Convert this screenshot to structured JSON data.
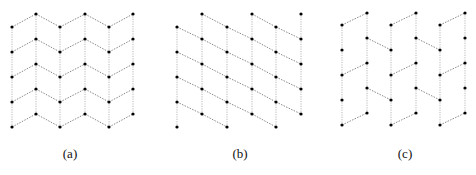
{
  "panels": [
    {
      "id": "a",
      "label": "(a)",
      "label_x": 70,
      "columns": [
        12,
        36,
        60,
        85,
        109,
        133
      ],
      "column_rows": [
        [
          27,
          52,
          77,
          102,
          127
        ],
        [
          14,
          39,
          64,
          89,
          114
        ],
        [
          27,
          52,
          77,
          102,
          127
        ],
        [
          14,
          39,
          64,
          89,
          114
        ],
        [
          27,
          52,
          77,
          102,
          127
        ],
        [
          14,
          39,
          64,
          89,
          114
        ]
      ],
      "edges": "zigzag-all"
    },
    {
      "id": "b",
      "label": "(b)",
      "label_x": 240,
      "columns": [
        177,
        202,
        227,
        252,
        276,
        301
      ],
      "column_rows": [
        [
          27,
          52,
          77,
          102,
          127
        ],
        [
          14,
          39,
          64,
          89,
          114
        ],
        [
          27,
          52,
          77,
          102,
          127
        ],
        [
          14,
          39,
          64,
          89,
          114
        ],
        [
          27,
          52,
          77,
          102,
          127
        ],
        [
          14,
          39,
          64,
          89,
          114
        ]
      ],
      "edges": "parallel-down"
    },
    {
      "id": "c",
      "label": "(c)",
      "label_x": 405,
      "columns": [
        342,
        367,
        391,
        416,
        440,
        465
      ],
      "column_rows": [
        [
          25,
          50,
          75,
          100,
          125
        ],
        [
          13,
          38,
          63,
          88,
          113
        ],
        [
          25,
          50,
          75,
          100,
          125
        ],
        [
          13,
          38,
          63,
          88,
          113
        ],
        [
          25,
          50,
          75,
          100,
          125
        ],
        [
          13,
          38,
          63,
          88,
          113
        ]
      ],
      "edges": "paired-alternating"
    }
  ],
  "colors": {
    "node": "#000000",
    "edge": "#777777",
    "background": "#ffffff"
  }
}
